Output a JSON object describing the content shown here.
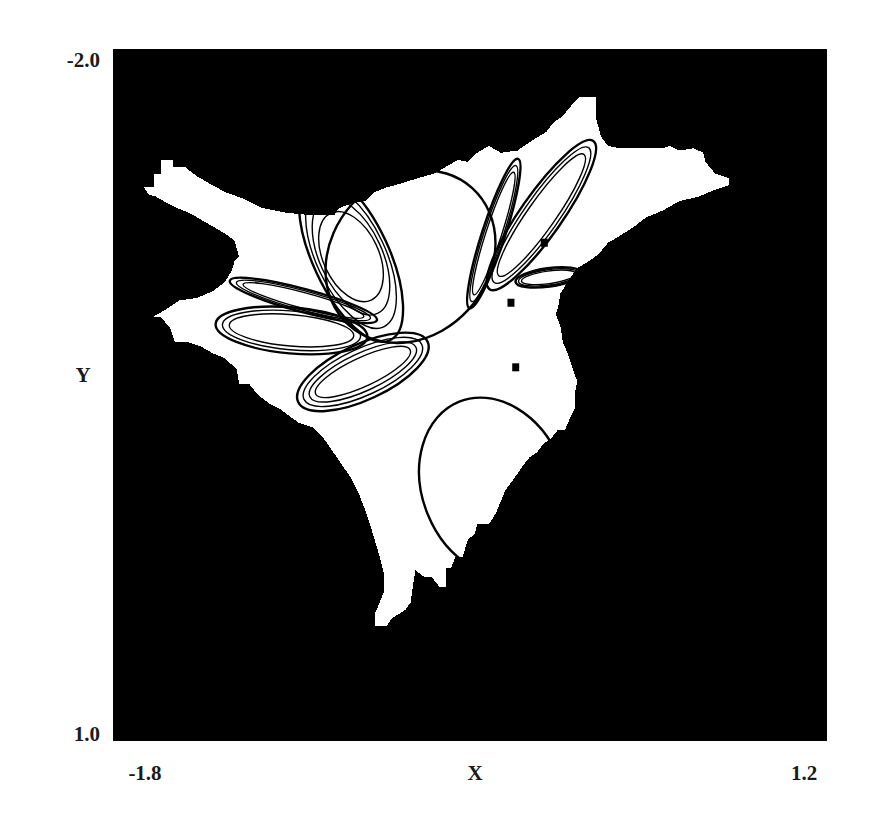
{
  "chart_data": {
    "type": "heatmap",
    "title": "",
    "xlabel": "X",
    "ylabel": "Y",
    "xlim": [
      -1.8,
      1.2
    ],
    "ylim": [
      -2.0,
      1.0
    ],
    "y_axis_inverted": true,
    "grid": false,
    "legend": "none",
    "x_tick_labels": [
      "-1.8",
      "1.2"
    ],
    "y_tick_labels": [
      "-2.0",
      "1.0"
    ],
    "colors": {
      "background_basin": "#000000",
      "bounded_basin": "#ffffff",
      "attractor": "#000000"
    },
    "basin_polygon": [
      [
        -1.67,
        -1.4
      ],
      [
        -1.63,
        -1.4
      ],
      [
        -1.63,
        -1.46
      ],
      [
        -1.6,
        -1.46
      ],
      [
        -1.6,
        -1.52
      ],
      [
        -1.55,
        -1.52
      ],
      [
        -1.55,
        -1.49
      ],
      [
        -1.5,
        -1.49
      ],
      [
        -1.45,
        -1.45
      ],
      [
        -1.4,
        -1.42
      ],
      [
        -1.33,
        -1.38
      ],
      [
        -1.25,
        -1.35
      ],
      [
        -1.17,
        -1.31
      ],
      [
        -1.07,
        -1.29
      ],
      [
        -0.97,
        -1.28
      ],
      [
        -0.87,
        -1.28
      ],
      [
        -0.85,
        -1.31
      ],
      [
        -0.8,
        -1.33
      ],
      [
        -0.74,
        -1.34
      ],
      [
        -0.7,
        -1.38
      ],
      [
        -0.65,
        -1.4
      ],
      [
        -0.58,
        -1.42
      ],
      [
        -0.52,
        -1.44
      ],
      [
        -0.45,
        -1.46
      ],
      [
        -0.4,
        -1.49
      ],
      [
        -0.35,
        -1.52
      ],
      [
        -0.31,
        -1.51
      ],
      [
        -0.27,
        -1.55
      ],
      [
        -0.22,
        -1.58
      ],
      [
        -0.17,
        -1.55
      ],
      [
        -0.1,
        -1.56
      ],
      [
        -0.03,
        -1.61
      ],
      [
        0.02,
        -1.64
      ],
      [
        0.05,
        -1.68
      ],
      [
        0.09,
        -1.71
      ],
      [
        0.13,
        -1.76
      ],
      [
        0.16,
        -1.79
      ],
      [
        0.23,
        -1.79
      ],
      [
        0.23,
        -1.7
      ],
      [
        0.25,
        -1.62
      ],
      [
        0.28,
        -1.58
      ],
      [
        0.33,
        -1.57
      ],
      [
        0.39,
        -1.57
      ],
      [
        0.44,
        -1.57
      ],
      [
        0.51,
        -1.57
      ],
      [
        0.54,
        -1.58
      ],
      [
        0.58,
        -1.56
      ],
      [
        0.64,
        -1.57
      ],
      [
        0.68,
        -1.55
      ],
      [
        0.69,
        -1.51
      ],
      [
        0.73,
        -1.46
      ],
      [
        0.79,
        -1.44
      ],
      [
        0.79,
        -1.41
      ],
      [
        0.73,
        -1.39
      ],
      [
        0.66,
        -1.36
      ],
      [
        0.58,
        -1.34
      ],
      [
        0.51,
        -1.3
      ],
      [
        0.44,
        -1.27
      ],
      [
        0.39,
        -1.23
      ],
      [
        0.33,
        -1.19
      ],
      [
        0.28,
        -1.16
      ],
      [
        0.24,
        -1.11
      ],
      [
        0.2,
        -1.08
      ],
      [
        0.15,
        -1.05
      ],
      [
        0.11,
        -0.99
      ],
      [
        0.08,
        -0.94
      ],
      [
        0.07,
        -0.88
      ],
      [
        0.06,
        -0.85
      ],
      [
        0.08,
        -0.8
      ],
      [
        0.09,
        -0.73
      ],
      [
        0.11,
        -0.68
      ],
      [
        0.13,
        -0.62
      ],
      [
        0.15,
        -0.56
      ],
      [
        0.14,
        -0.5
      ],
      [
        0.14,
        -0.44
      ],
      [
        0.12,
        -0.4
      ],
      [
        0.1,
        -0.35
      ],
      [
        0.07,
        -0.35
      ],
      [
        0.04,
        -0.31
      ],
      [
        0.01,
        -0.29
      ],
      [
        -0.02,
        -0.25
      ],
      [
        -0.05,
        -0.23
      ],
      [
        -0.08,
        -0.19
      ],
      [
        -0.1,
        -0.16
      ],
      [
        -0.12,
        -0.13
      ],
      [
        -0.15,
        -0.09
      ],
      [
        -0.17,
        -0.04
      ],
      [
        -0.19,
        0.01
      ],
      [
        -0.22,
        0.06
      ],
      [
        -0.27,
        0.06
      ],
      [
        -0.28,
        0.1
      ],
      [
        -0.31,
        0.13
      ],
      [
        -0.33,
        0.2
      ],
      [
        -0.36,
        0.2
      ],
      [
        -0.38,
        0.25
      ],
      [
        -0.4,
        0.25
      ],
      [
        -0.4,
        0.33
      ],
      [
        -0.43,
        0.33
      ],
      [
        -0.46,
        0.29
      ],
      [
        -0.49,
        0.29
      ],
      [
        -0.53,
        0.26
      ],
      [
        -0.54,
        0.33
      ],
      [
        -0.55,
        0.4
      ],
      [
        -0.57,
        0.43
      ],
      [
        -0.6,
        0.45
      ],
      [
        -0.63,
        0.47
      ],
      [
        -0.65,
        0.5
      ],
      [
        -0.7,
        0.5
      ],
      [
        -0.7,
        0.45
      ],
      [
        -0.68,
        0.4
      ],
      [
        -0.66,
        0.35
      ],
      [
        -0.66,
        0.28
      ],
      [
        -0.68,
        0.2
      ],
      [
        -0.7,
        0.13
      ],
      [
        -0.72,
        0.06
      ],
      [
        -0.74,
        0.0
      ],
      [
        -0.77,
        -0.08
      ],
      [
        -0.8,
        -0.14
      ],
      [
        -0.84,
        -0.2
      ],
      [
        -0.88,
        -0.26
      ],
      [
        -0.92,
        -0.32
      ],
      [
        -0.96,
        -0.36
      ],
      [
        -1.02,
        -0.38
      ],
      [
        -1.06,
        -0.41
      ],
      [
        -1.1,
        -0.44
      ],
      [
        -1.14,
        -0.46
      ],
      [
        -1.19,
        -0.5
      ],
      [
        -1.23,
        -0.55
      ],
      [
        -1.27,
        -0.55
      ],
      [
        -1.28,
        -0.61
      ],
      [
        -1.33,
        -0.66
      ],
      [
        -1.38,
        -0.68
      ],
      [
        -1.43,
        -0.71
      ],
      [
        -1.49,
        -0.73
      ],
      [
        -1.54,
        -0.73
      ],
      [
        -1.56,
        -0.79
      ],
      [
        -1.6,
        -0.84
      ],
      [
        -1.63,
        -0.84
      ],
      [
        -1.58,
        -0.87
      ],
      [
        -1.52,
        -0.91
      ],
      [
        -1.45,
        -0.92
      ],
      [
        -1.38,
        -0.95
      ],
      [
        -1.33,
        -0.99
      ],
      [
        -1.3,
        -1.04
      ],
      [
        -1.29,
        -1.08
      ],
      [
        -1.27,
        -1.1
      ],
      [
        -1.29,
        -1.17
      ],
      [
        -1.33,
        -1.2
      ],
      [
        -1.38,
        -1.23
      ],
      [
        -1.43,
        -1.26
      ],
      [
        -1.48,
        -1.29
      ],
      [
        -1.53,
        -1.31
      ],
      [
        -1.57,
        -1.33
      ],
      [
        -1.62,
        -1.36
      ],
      [
        -1.65,
        -1.37
      ]
    ],
    "basin_holes": [
      [
        -0.13,
        -0.9
      ],
      [
        -0.11,
        -0.62
      ],
      [
        -0.09,
        -0.1
      ],
      [
        0.18,
        -1.02
      ],
      [
        0.14,
        -0.99
      ],
      [
        0.01,
        -1.16
      ]
    ],
    "attractor_loops": [
      {
        "name": "large-upper-oval",
        "cx": -0.55,
        "cy": -1.1,
        "rx": 0.33,
        "ry": 0.4,
        "rot": 42,
        "strands": 1
      },
      {
        "name": "large-lower-oval",
        "cx": -0.2,
        "cy": -0.1,
        "rx": 0.3,
        "ry": 0.4,
        "rot": -22,
        "strands": 1
      },
      {
        "name": "upper-left-lobe",
        "cx": -0.8,
        "cy": -1.1,
        "rx": 0.16,
        "ry": 0.4,
        "rot": -25,
        "strands": 4
      },
      {
        "name": "left-horizontal-lobe",
        "cx": -1.05,
        "cy": -0.78,
        "rx": 0.32,
        "ry": 0.1,
        "rot": 5,
        "strands": 3
      },
      {
        "name": "left-thin-lobe",
        "cx": -1.0,
        "cy": -0.91,
        "rx": 0.32,
        "ry": 0.05,
        "rot": 15,
        "strands": 3
      },
      {
        "name": "lower-left-lobe",
        "cx": -0.75,
        "cy": -0.6,
        "rx": 0.3,
        "ry": 0.12,
        "rot": -25,
        "strands": 4
      },
      {
        "name": "upper-right-lobe",
        "cx": 0.0,
        "cy": -1.28,
        "rx": 0.38,
        "ry": 0.09,
        "rot": -55,
        "strands": 3
      },
      {
        "name": "upper-mid-lobe",
        "cx": -0.2,
        "cy": -1.2,
        "rx": 0.33,
        "ry": 0.05,
        "rot": -72,
        "strands": 3
      },
      {
        "name": "right-small-lobe",
        "cx": 0.03,
        "cy": -1.01,
        "rx": 0.14,
        "ry": 0.04,
        "rot": -8,
        "strands": 3
      }
    ]
  }
}
